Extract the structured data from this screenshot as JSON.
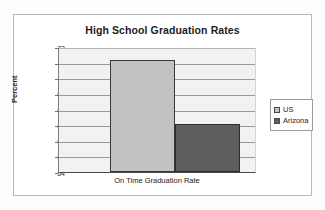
{
  "chart_data": {
    "type": "bar",
    "title": "High School Graduation Rates",
    "xlabel": "On Time Graduation Rate",
    "ylabel": "Percent",
    "categories": [
      "On Time Graduation Rate"
    ],
    "series": [
      {
        "name": "US",
        "values": [
          71.2
        ],
        "color": "#c2c2c2"
      },
      {
        "name": "Arizona",
        "values": [
          67.1
        ],
        "color": "#5e5e5e"
      }
    ],
    "ylim": [
      64,
      72
    ],
    "yticks": [
      72,
      71,
      70,
      69,
      68,
      67,
      66,
      65,
      64
    ],
    "ytick_labels": [
      "72",
      "71",
      "70",
      "69",
      "68",
      "67",
      "66",
      "65",
      "64"
    ],
    "grid": true,
    "legend_position": "right",
    "legend_entries": [
      "US",
      "Arizona"
    ]
  },
  "legend": {
    "items": [
      {
        "label": "US"
      },
      {
        "label": "Arizona"
      }
    ]
  }
}
